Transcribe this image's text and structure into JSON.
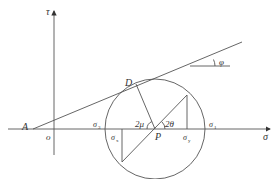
{
  "diagram": {
    "axes": {
      "vertical_label": "τ",
      "horizontal_label": "σ",
      "origin_label": "o"
    },
    "points": {
      "A": "A",
      "D": "D",
      "P": "P"
    },
    "angles": {
      "friction": "φ",
      "mu": "2μ",
      "theta": "2θ"
    },
    "stress_labels": {
      "sigma3": {
        "base": "σ",
        "sub": "3"
      },
      "sigma1": {
        "base": "σ",
        "sub": "1"
      },
      "sigmax": {
        "base": "σ",
        "sub": "x"
      },
      "sigmay": {
        "base": "σ",
        "sub": "y"
      }
    },
    "colors": {
      "line": "#555555",
      "text": "#333333"
    }
  }
}
